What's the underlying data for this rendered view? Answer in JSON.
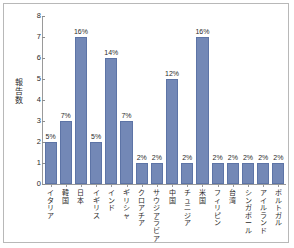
{
  "chart_data": {
    "type": "bar",
    "title": "",
    "subtitle": "",
    "xlabel": "",
    "ylabel": "報告数",
    "ylim": [
      0,
      8
    ],
    "ytick_labels": [
      "0",
      "1",
      "2",
      "3",
      "4",
      "5",
      "6",
      "7",
      "8"
    ],
    "yticks": [
      0,
      1,
      2,
      3,
      4,
      5,
      6,
      7,
      8
    ],
    "grid": false,
    "legend": false,
    "bar_color": "#7388b6",
    "bar_edge_color": "#5d74a6",
    "categories": [
      "イタリア",
      "韓国",
      "日本",
      "イギリス",
      "インド",
      "ギリシャ",
      "クロアチア",
      "サウジアラビア",
      "中国",
      "チュニジア",
      "米国",
      "フィリピン",
      "台湾",
      "シンガポール",
      "アイルランド",
      "ポルトガル"
    ],
    "values": [
      2,
      3,
      7,
      2,
      6,
      3,
      1,
      1,
      5,
      1,
      7,
      1,
      1,
      1,
      1,
      1
    ],
    "data_labels": [
      "5%",
      "7%",
      "16%",
      "5%",
      "14%",
      "7%",
      "2%",
      "2%",
      "12%",
      "2%",
      "16%",
      "2%",
      "2%",
      "2%",
      "2%",
      "2%"
    ]
  }
}
